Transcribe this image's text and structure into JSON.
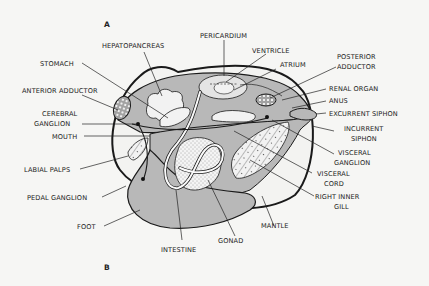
{
  "figure": {
    "orientation_labels": {
      "top": "A",
      "bottom": "B"
    },
    "colors": {
      "background": "#f6f6f4",
      "body_fill": "#b8b8b8",
      "outline": "#1a1a1a",
      "organ_fill": "#f2f2f2"
    },
    "labels": {
      "stomach": "STOMACH",
      "hepatopancreas": "HEPATOPANCREAS",
      "pericardium": "PERICARDIUM",
      "ventricle": "VENTRICLE",
      "atrium": "ATRIUM",
      "posterior_adductor_1": "POSTERIOR",
      "posterior_adductor_2": "ADDUCTOR",
      "anterior_adductor": "ANTERIOR  ADDUCTOR",
      "cerebral_ganglion_1": "CEREBRAL",
      "cerebral_ganglion_2": "GANGLION",
      "mouth": "MOUTH",
      "labial_palps": "LABIAL  PALPS",
      "pedal_ganglion": "PEDAL  GANGLION",
      "foot": "FOOT",
      "intestine": "INTESTINE",
      "gonad": "GONAD",
      "mantle": "MANTLE",
      "right_inner_gill_1": "RIGHT  INNER",
      "right_inner_gill_2": "GILL",
      "visceral_cord_1": "VISCERAL",
      "visceral_cord_2": "CORD",
      "visceral_ganglion_1": "VISCERAL",
      "visceral_ganglion_2": "GANGLION",
      "incurrent_siphon_1": "INCURRENT",
      "incurrent_siphon_2": "SIPHON",
      "excurrent_siphon": "EXCURRENT  SIPHON",
      "anus": "ANUS",
      "renal_organ": "RENAL  ORGAN"
    }
  }
}
